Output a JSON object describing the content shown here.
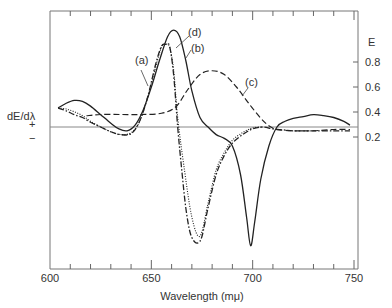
{
  "chart_data": {
    "type": "line",
    "title": "",
    "xlabel": "Wavelength (mμ)",
    "ylabel_left": "dE/dλ",
    "ylabel_right": "E",
    "sign_labels": {
      "positive": "+",
      "negative": "−"
    },
    "xlim": [
      600,
      750
    ],
    "x_ticks": [
      600,
      650,
      700,
      750
    ],
    "x_tick_labels": [
      "600",
      "650",
      "700",
      "750"
    ],
    "x_minor_step": 10,
    "right_ylim": [
      0.0,
      1.0
    ],
    "right_y_ticks": [
      0.2,
      0.4,
      0.6,
      0.8
    ],
    "right_y_tick_labels": [
      "0.2",
      "0.4",
      "0.6",
      "0.8"
    ],
    "grid": false,
    "zero_line": true,
    "derivative_scale_note": "left axis unscaled (relative derivative, zero line shown)",
    "series": [
      {
        "name": "(a)",
        "style": "solid",
        "axis": "derivative",
        "x": [
          604,
          608,
          612,
          616,
          620,
          625,
          630,
          634,
          638,
          642,
          646,
          650,
          654,
          658,
          661,
          664,
          667,
          670,
          674,
          678,
          682,
          686,
          690,
          694,
          697,
          699,
          701,
          704,
          708,
          712,
          716,
          720,
          725,
          730,
          735,
          740,
          745,
          748
        ],
        "y": [
          0.2,
          0.25,
          0.28,
          0.27,
          0.22,
          0.13,
          0.04,
          -0.02,
          -0.04,
          0.02,
          0.18,
          0.42,
          0.7,
          0.95,
          1.02,
          0.95,
          0.7,
          0.38,
          0.1,
          0.0,
          -0.08,
          -0.12,
          -0.2,
          -0.5,
          -0.95,
          -1.25,
          -1.0,
          -0.55,
          -0.2,
          0.0,
          0.06,
          0.09,
          0.11,
          0.13,
          0.12,
          0.1,
          0.06,
          0.02
        ]
      },
      {
        "name": "(d)",
        "style": "dash-dot",
        "axis": "derivative",
        "x": [
          604,
          608,
          612,
          616,
          620,
          625,
          630,
          635,
          640,
          644,
          648,
          652,
          655,
          657,
          659,
          661,
          663,
          665,
          667,
          669,
          671,
          673,
          675,
          678,
          682,
          686,
          690,
          695,
          700,
          705,
          710,
          715,
          720,
          730,
          740,
          748
        ],
        "y": [
          0.2,
          0.17,
          0.13,
          0.1,
          0.05,
          0.0,
          -0.05,
          -0.08,
          -0.07,
          0.05,
          0.3,
          0.65,
          0.85,
          0.87,
          0.85,
          0.55,
          0.0,
          -0.45,
          -0.85,
          -1.1,
          -1.2,
          -1.22,
          -1.15,
          -0.85,
          -0.5,
          -0.3,
          -0.17,
          -0.08,
          -0.02,
          0.0,
          -0.02,
          -0.03,
          -0.04,
          -0.04,
          -0.04,
          -0.04
        ]
      },
      {
        "name": "(b)",
        "style": "dotted",
        "axis": "derivative",
        "x": [
          604,
          608,
          612,
          616,
          620,
          625,
          630,
          635,
          640,
          644,
          648,
          652,
          655,
          657,
          659,
          661,
          663,
          666,
          670,
          674,
          678,
          682,
          686,
          690,
          695,
          700,
          705
        ],
        "y": [
          0.2,
          0.19,
          0.16,
          0.12,
          0.06,
          0.0,
          -0.05,
          -0.08,
          -0.06,
          0.05,
          0.3,
          0.62,
          0.84,
          0.87,
          0.84,
          0.6,
          0.1,
          -0.4,
          -0.95,
          -1.15,
          -0.8,
          -0.45,
          -0.27,
          -0.14,
          -0.06,
          -0.01,
          0.0
        ]
      },
      {
        "name": "(c)",
        "style": "dashed",
        "axis": "E",
        "x": [
          618,
          625,
          635,
          645,
          655,
          662,
          668,
          674,
          680,
          686,
          692,
          698,
          704,
          708,
          712,
          720,
          730,
          740,
          748
        ],
        "y": [
          0.37,
          0.38,
          0.38,
          0.38,
          0.39,
          0.44,
          0.58,
          0.7,
          0.73,
          0.7,
          0.6,
          0.47,
          0.35,
          0.29,
          0.26,
          0.25,
          0.25,
          0.26,
          0.26
        ]
      }
    ]
  }
}
